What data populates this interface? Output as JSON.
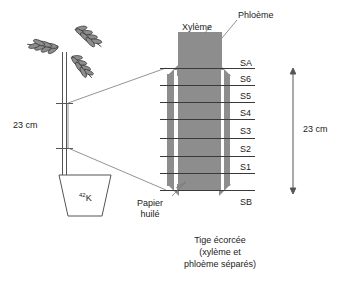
{
  "diagram": {
    "title_parts": {
      "xylem": "Xylème",
      "phloem": "Phloème",
      "oiled_paper": "Papier\nhuilé",
      "oiled_paper_line1": "Papier",
      "oiled_paper_line2": "huilé"
    },
    "caption": {
      "line1": "Tige écorcée",
      "line2": "(xylème et",
      "line3": "phloème séparés)"
    },
    "tracer": {
      "mass_number": "42",
      "element": "K"
    },
    "dimensions": {
      "plant_section": "23 cm",
      "stem_section": "23 cm"
    },
    "segments": [
      {
        "id": "SA",
        "label": "SA"
      },
      {
        "id": "S6",
        "label": "S6"
      },
      {
        "id": "S5",
        "label": "S5"
      },
      {
        "id": "S4",
        "label": "S4"
      },
      {
        "id": "S3",
        "label": "S3"
      },
      {
        "id": "S2",
        "label": "S2"
      },
      {
        "id": "S1",
        "label": "S1"
      },
      {
        "id": "SB",
        "label": "SB"
      }
    ],
    "colors": {
      "tissue_gray": "#8d8d8d",
      "line_dark": "#3a3a3a",
      "outline": "#555555",
      "background": "#ffffff"
    }
  }
}
